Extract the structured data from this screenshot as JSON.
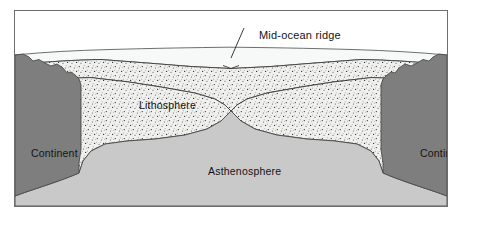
{
  "figure": {
    "type": "geology-cross-section",
    "frame": {
      "border_color": "#6e6e6e",
      "background": "#ffffff"
    }
  },
  "labels": {
    "mid_ocean_ridge": "Mid-ocean ridge",
    "lithosphere": "Lithosphere",
    "asthenosphere": "Asthenosphere",
    "continent_left": "Continent",
    "continent_right": "Continent"
  },
  "layers": [
    {
      "name": "ocean-water",
      "label": "",
      "fill": "#f7f8f8",
      "stroke": "#4a4a4a",
      "description": "Ocean water wedge between sea surface and sea floor"
    },
    {
      "name": "lithosphere",
      "label": "Lithosphere",
      "fill": "#f0f0ef",
      "pattern": "stipple-dots",
      "pattern_dot_color": "#2e2e2e",
      "stroke": "#3b3b3b",
      "description": "Stippled rigid plate layer split at the ridge axis"
    },
    {
      "name": "asthenosphere",
      "label": "Asthenosphere",
      "fill": "#c9c9c9",
      "stroke": "#4a4a4a",
      "description": "Light grey plastic mantle rising as a peak beneath the ridge"
    },
    {
      "name": "continent-left",
      "label": "Continent",
      "fill": "#7e7e7e",
      "stroke": "#4a4a4a",
      "description": "Dark grey continental block at left margin"
    },
    {
      "name": "continent-right",
      "label": "Continent",
      "fill": "#7e7e7e",
      "stroke": "#4a4a4a",
      "description": "Dark grey continental block at right margin"
    }
  ],
  "annotation": {
    "name": "mid-ocean-ridge-callout",
    "text": "Mid-ocean ridge",
    "leader_line": {
      "from_x": 243,
      "from_y": 27,
      "to_x": 216,
      "to_y": 57
    }
  },
  "colors": {
    "frame_border": "#6e6e6e",
    "page_background": "#ffffff",
    "water": "#f7f8f8",
    "lithosphere": "#f0f0ef",
    "asthenosphere": "#c9c9c9",
    "continent": "#7e7e7e",
    "outline": "#3b3b3b",
    "text": "#141414"
  }
}
